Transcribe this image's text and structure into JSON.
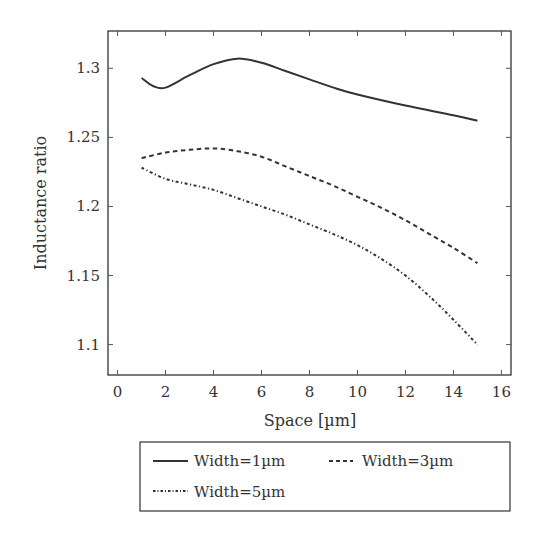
{
  "chart_data": {
    "type": "line",
    "title": "",
    "xlabel": "Space [µm]",
    "ylabel": "Inductance ratio",
    "xlim": [
      -0.4,
      16.4
    ],
    "ylim": [
      1.078,
      1.327
    ],
    "xticks": [
      0,
      2,
      4,
      6,
      8,
      10,
      12,
      14,
      16
    ],
    "yticks": [
      1.1,
      1.15,
      1.2,
      1.25,
      1.3
    ],
    "ytick_labels": [
      "1.1",
      "1.15",
      "1.2",
      "1.25",
      "1.3"
    ],
    "grid": false,
    "legend_position": "below",
    "series": [
      {
        "name": "Width=1µm",
        "style": "solid",
        "x": [
          1,
          1.5,
          2,
          3,
          4,
          5,
          6,
          7,
          8,
          9,
          10,
          12,
          14,
          15
        ],
        "values": [
          1.293,
          1.287,
          1.286,
          1.295,
          1.303,
          1.307,
          1.304,
          1.298,
          1.292,
          1.286,
          1.281,
          1.273,
          1.266,
          1.262
        ]
      },
      {
        "name": "Width=3µm",
        "style": "dashed",
        "x": [
          1,
          2,
          3,
          4,
          5,
          6,
          7,
          8,
          9,
          10,
          11,
          12,
          13,
          14,
          15
        ],
        "values": [
          1.235,
          1.239,
          1.241,
          1.242,
          1.24,
          1.236,
          1.229,
          1.222,
          1.215,
          1.207,
          1.199,
          1.19,
          1.18,
          1.17,
          1.159
        ]
      },
      {
        "name": "Width=5µm",
        "style": "dash-dot",
        "x": [
          1,
          2,
          3,
          4,
          5,
          6,
          7,
          8,
          9,
          10,
          11,
          12,
          13,
          14,
          15
        ],
        "values": [
          1.228,
          1.22,
          1.216,
          1.212,
          1.206,
          1.2,
          1.194,
          1.187,
          1.18,
          1.172,
          1.162,
          1.15,
          1.135,
          1.118,
          1.1
        ]
      }
    ]
  },
  "legend": {
    "items": [
      "Width=1µm",
      "Width=3µm",
      "Width=5µm"
    ]
  },
  "axes": {
    "xlabel": "Space [µm]",
    "ylabel": "Inductance ratio"
  }
}
